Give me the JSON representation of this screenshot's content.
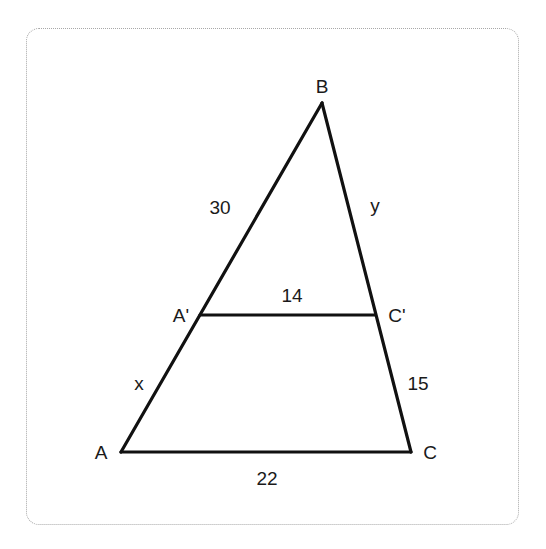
{
  "diagram": {
    "type": "similar-triangles",
    "vertices": {
      "B": {
        "label": "B",
        "x": 322,
        "y": 103
      },
      "A": {
        "label": "A",
        "x": 121,
        "y": 452
      },
      "C": {
        "label": "C",
        "x": 411,
        "y": 452
      },
      "A_prime": {
        "label": "A'",
        "x": 200,
        "y": 315
      },
      "C_prime": {
        "label": "C'",
        "x": 375,
        "y": 315
      }
    },
    "segment_labels": {
      "BA_prime": "30",
      "BC_prime": "y",
      "A_primeC_prime": "14",
      "A_primeA": "x",
      "C_primeC": "15",
      "AC": "22"
    },
    "colors": {
      "line": "#111111",
      "text": "#1a1a1a",
      "border": "#a8a8a8",
      "background": "#ffffff"
    }
  }
}
